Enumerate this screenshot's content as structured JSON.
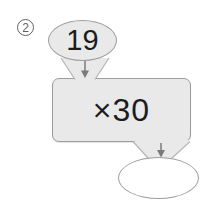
{
  "figure": {
    "problem_number": "2",
    "input_value": "19",
    "operation": "×30",
    "answer_value": ""
  },
  "colors": {
    "background": "#ffffff",
    "shape_fill": "#e9e9e9",
    "shape_border": "#9c9c9c",
    "connector_border": "#b4b4b4",
    "arrow": "#7a7a7a",
    "text": "#1c1c1c",
    "label": "#5f5f5f",
    "answer_fill": "#ffffff"
  }
}
